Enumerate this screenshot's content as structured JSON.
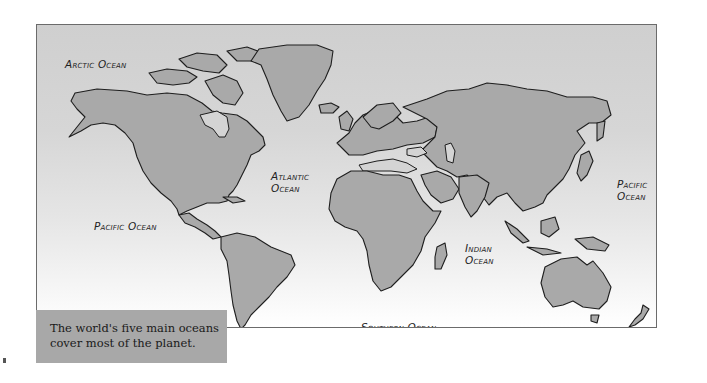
{
  "map": {
    "title": "World oceans map",
    "colors": {
      "ocean_top": "#cfcfcf",
      "ocean_bottom": "#ffffff",
      "land": "#a9a9a9",
      "outline": "#1e1e1e",
      "caption_bg": "#a8a8a8"
    },
    "labels": {
      "arctic": "Arctic Ocean",
      "atlantic_line1": "Atlantic",
      "atlantic_line2": "Ocean",
      "pacific_west": "Pacific Ocean",
      "pacific_east_line1": "Pacific",
      "pacific_east_line2": "Ocean",
      "indian_line1": "Indian",
      "indian_line2": "Ocean",
      "southern": "Southern Ocean"
    }
  },
  "caption": {
    "line1": "The world's five main oceans",
    "line2": "cover most of the planet."
  }
}
